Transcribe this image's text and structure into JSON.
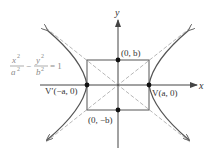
{
  "diagram": {
    "equation": {
      "num1": "x",
      "den1": "a",
      "minus": "−",
      "num2": "y",
      "den2": "b",
      "sup": "2",
      "rhs": "= 1"
    },
    "axes": {
      "x_label": "x",
      "y_label": "y"
    },
    "points": {
      "co_vertex_top": "(0, b)",
      "co_vertex_bottom": "(0, −b)",
      "vertex_right": "V(a, 0)",
      "vertex_left": "V′(−a, 0)"
    },
    "colors": {
      "curve": "#555555",
      "axes": "#444444",
      "asymptote": "#b0b0b0",
      "box": "#555555",
      "equation": "#8a8a8a"
    }
  }
}
